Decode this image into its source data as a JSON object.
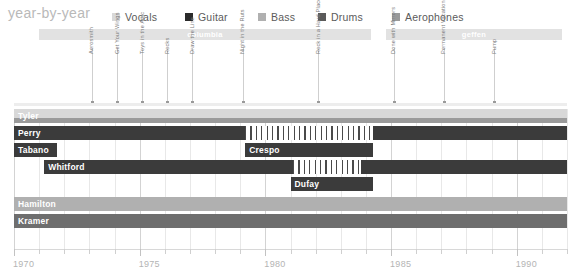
{
  "header": {
    "title": "year-by-year"
  },
  "legend": {
    "items": [
      {
        "label": "Vocals",
        "color": "#d8d8d8",
        "x": 112
      },
      {
        "label": "Guitar",
        "color": "#2b2b2b",
        "x": 185
      },
      {
        "label": "Bass",
        "color": "#b0b0b0",
        "x": 258
      },
      {
        "label": "Drums",
        "color": "#5a5a5a",
        "x": 318
      },
      {
        "label": "Aerophones",
        "color": "#9a9a9a",
        "x": 392
      }
    ]
  },
  "labels_bands": [
    {
      "name": "columbia",
      "start": 1971.0,
      "end": 1984.2,
      "color": "#e2e2e2"
    },
    {
      "name": "geffen",
      "start": 1984.8,
      "end": 1991.8,
      "color": "#e2e2e2"
    }
  ],
  "albums": [
    {
      "title": "Aerosmith",
      "year": 1973.1
    },
    {
      "title": "Get Your Wings",
      "year": 1974.1
    },
    {
      "title": "Toys in the Attic",
      "year": 1975.1
    },
    {
      "title": "Rocks",
      "year": 1976.1
    },
    {
      "title": "Draw the Line",
      "year": 1977.1
    },
    {
      "title": "Night in the Ruts",
      "year": 1979.1
    },
    {
      "title": "Rock in a Hard Place",
      "year": 1982.1
    },
    {
      "title": "Done with Mirrors",
      "year": 1985.1
    },
    {
      "title": "Permanent Vacation",
      "year": 1987.1
    },
    {
      "title": "Pump",
      "year": 1989.1
    }
  ],
  "members": [
    {
      "name": "Tyler",
      "segments": [
        {
          "start": 1970.0,
          "end": 1992.0,
          "role": "Vocals",
          "color": "#d8d8d8",
          "kind": "solid",
          "sub": "top"
        },
        {
          "start": 1970.0,
          "end": 1992.0,
          "role": "Aerophones",
          "color": "#9a9a9a",
          "kind": "solid",
          "sub": "bottom"
        }
      ]
    },
    {
      "name": "Perry",
      "segments": [
        {
          "start": 1970.0,
          "end": 1979.2,
          "role": "Guitar",
          "color": "#3b3b3b",
          "kind": "solid"
        },
        {
          "start": 1979.2,
          "end": 1984.3,
          "role": "Guitar",
          "color": "#3b3b3b",
          "kind": "hatch"
        },
        {
          "start": 1984.3,
          "end": 1992.0,
          "role": "Guitar",
          "color": "#3b3b3b",
          "kind": "solid"
        }
      ]
    },
    {
      "name": "Tabano",
      "segments": [
        {
          "start": 1970.0,
          "end": 1971.7,
          "role": "Guitar",
          "color": "#3b3b3b",
          "kind": "solid"
        }
      ]
    },
    {
      "name": "Crespo",
      "segments": [
        {
          "start": 1979.2,
          "end": 1984.3,
          "role": "Guitar",
          "color": "#3b3b3b",
          "kind": "solid"
        }
      ]
    },
    {
      "name": "Whitford",
      "segments": [
        {
          "start": 1971.2,
          "end": 1981.1,
          "role": "Guitar",
          "color": "#3b3b3b",
          "kind": "solid"
        },
        {
          "start": 1981.1,
          "end": 1983.8,
          "role": "Guitar",
          "color": "#3b3b3b",
          "kind": "hatch"
        },
        {
          "start": 1983.8,
          "end": 1992.0,
          "role": "Guitar",
          "color": "#3b3b3b",
          "kind": "solid"
        }
      ]
    },
    {
      "name": "Dufay",
      "segments": [
        {
          "start": 1981.0,
          "end": 1984.3,
          "role": "Guitar",
          "color": "#3b3b3b",
          "kind": "solid"
        }
      ]
    },
    {
      "name": "Hamilton",
      "segments": [
        {
          "start": 1970.0,
          "end": 1992.0,
          "role": "Bass",
          "color": "#b0b0b0",
          "kind": "solid"
        }
      ]
    },
    {
      "name": "Kramer",
      "segments": [
        {
          "start": 1970.0,
          "end": 1992.0,
          "role": "Drums",
          "color": "#6e6e6e",
          "kind": "solid"
        }
      ]
    }
  ],
  "axis": {
    "min": 1970,
    "max": 1992,
    "major_ticks": [
      1970,
      1975,
      1980,
      1985,
      1990
    ],
    "major_labels": [
      "1970",
      "1975",
      "1980",
      "1985",
      "1990"
    ],
    "minor_step": 1
  },
  "chart_data": {
    "type": "timeline",
    "title": "year-by-year",
    "xlabel": "",
    "ylabel": "",
    "xlim": [
      1970,
      1992
    ],
    "grid": true,
    "legend_position": "top",
    "categories": [
      "Tyler",
      "Perry",
      "Tabano",
      "Crespo",
      "Whitford",
      "Dufay",
      "Hamilton",
      "Kramer"
    ],
    "legend_entries": [
      "Vocals",
      "Guitar",
      "Bass",
      "Drums",
      "Aerophones"
    ],
    "annotations": [
      "columbia",
      "geffen"
    ],
    "series": [
      {
        "name": "Tyler",
        "role": [
          "Vocals",
          "Aerophones"
        ],
        "spans": [
          [
            1970,
            1992
          ]
        ]
      },
      {
        "name": "Perry",
        "role": [
          "Guitar"
        ],
        "spans": [
          [
            1970,
            1979.2
          ],
          [
            1984.3,
            1992
          ]
        ],
        "absent": [
          [
            1979.2,
            1984.3
          ]
        ]
      },
      {
        "name": "Tabano",
        "role": [
          "Guitar"
        ],
        "spans": [
          [
            1970,
            1971.7
          ]
        ]
      },
      {
        "name": "Crespo",
        "role": [
          "Guitar"
        ],
        "spans": [
          [
            1979.2,
            1984.3
          ]
        ]
      },
      {
        "name": "Whitford",
        "role": [
          "Guitar"
        ],
        "spans": [
          [
            1971.2,
            1981.1
          ],
          [
            1983.8,
            1992
          ]
        ],
        "absent": [
          [
            1981.1,
            1983.8
          ]
        ]
      },
      {
        "name": "Dufay",
        "role": [
          "Guitar"
        ],
        "spans": [
          [
            1981.0,
            1984.3
          ]
        ]
      },
      {
        "name": "Hamilton",
        "role": [
          "Bass"
        ],
        "spans": [
          [
            1970,
            1992
          ]
        ]
      },
      {
        "name": "Kramer",
        "role": [
          "Drums"
        ],
        "spans": [
          [
            1970,
            1992
          ]
        ]
      }
    ],
    "album_releases": [
      {
        "title": "Aerosmith",
        "year": 1973
      },
      {
        "title": "Get Your Wings",
        "year": 1974
      },
      {
        "title": "Toys in the Attic",
        "year": 1975
      },
      {
        "title": "Rocks",
        "year": 1976
      },
      {
        "title": "Draw the Line",
        "year": 1977
      },
      {
        "title": "Night in the Ruts",
        "year": 1979
      },
      {
        "title": "Rock in a Hard Place",
        "year": 1982
      },
      {
        "title": "Done with Mirrors",
        "year": 1985
      },
      {
        "title": "Permanent Vacation",
        "year": 1987
      },
      {
        "title": "Pump",
        "year": 1989
      }
    ]
  }
}
